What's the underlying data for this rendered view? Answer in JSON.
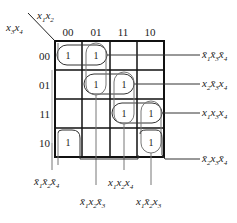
{
  "kmap": {
    "row_var_label": "x3x4",
    "col_var_label": "x1x2",
    "col_headers": [
      "00",
      "01",
      "11",
      "10"
    ],
    "row_headers": [
      "00",
      "01",
      "11",
      "10"
    ],
    "cells": [
      [
        "1",
        "1",
        "",
        ""
      ],
      [
        "",
        "1",
        "1",
        ""
      ],
      [
        "",
        "",
        "1",
        "1"
      ],
      [
        "1",
        "",
        "",
        "1"
      ]
    ],
    "cell_value": "1"
  },
  "terms": {
    "right": [
      {
        "label": "x̄1x̄3x̄4",
        "parts": [
          "x̄",
          "1",
          "x̄",
          "3",
          "x̄",
          "4"
        ]
      },
      {
        "label": "x2x̄3x4",
        "parts": [
          "x",
          "2",
          "x̄",
          "3",
          "x",
          "4"
        ]
      },
      {
        "label": "x1x3x4",
        "parts": [
          "x",
          "1",
          "x",
          "3",
          "x",
          "4"
        ]
      },
      {
        "label": "x̄2x3x̄4",
        "parts": [
          "x̄",
          "2",
          "x",
          "3",
          "x̄",
          "4"
        ]
      }
    ],
    "bottom": [
      {
        "label": "x̄1x̄2x̄4",
        "parts": [
          "x̄",
          "1",
          "x̄",
          "2",
          "x̄",
          "4"
        ]
      },
      {
        "label": "x1x2x4",
        "parts": [
          "x",
          "1",
          "x",
          "2",
          "x",
          "4"
        ]
      },
      {
        "label": "x̄1x2x̄3",
        "parts": [
          "x̄",
          "1",
          "x",
          "2",
          "x̄",
          "3"
        ]
      },
      {
        "label": "x1x̄2x3",
        "parts": [
          "x",
          "1",
          "x̄",
          "2",
          "x",
          "3"
        ]
      }
    ]
  }
}
